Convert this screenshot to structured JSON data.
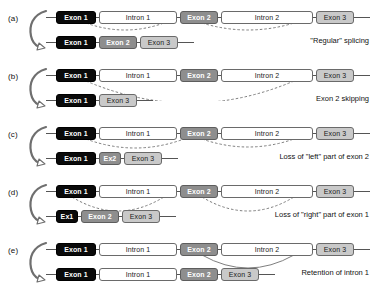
{
  "figure": {
    "panels": [
      {
        "letter": "(a)",
        "caption": "\"Regular\" splicing",
        "arrow_icon": "curved-splice-arrow-icon",
        "pre_mrna": [
          {
            "label": "Exon 1",
            "kind": "exon1",
            "width": 40
          },
          {
            "label": "Intron 1",
            "kind": "intron",
            "width": 78
          },
          {
            "label": "Exon 2",
            "kind": "exon2",
            "width": 38
          },
          {
            "label": "Intron 2",
            "kind": "intron",
            "width": 92
          },
          {
            "label": "Exon 3",
            "kind": "exon3",
            "width": 38
          }
        ],
        "mature_mrna": [
          {
            "label": "Exon 1",
            "kind": "exon1",
            "width": 40
          },
          {
            "label": "Exon 2",
            "kind": "exon2",
            "width": 38
          },
          {
            "label": "Exon 3",
            "kind": "exon3",
            "width": 38
          }
        ],
        "arcs": [
          {
            "x1": 40,
            "x2": 118,
            "depth": 7
          },
          {
            "x1": 156,
            "x2": 248,
            "depth": 7
          }
        ]
      },
      {
        "letter": "(b)",
        "caption": "Exon 2 skipping",
        "arrow_icon": "curved-splice-arrow-icon",
        "pre_mrna": [
          {
            "label": "Exon 1",
            "kind": "exon1",
            "width": 40
          },
          {
            "label": "Intron 1",
            "kind": "intron",
            "width": 78
          },
          {
            "label": "Exon 2",
            "kind": "exon2",
            "width": 38
          },
          {
            "label": "Intron 2",
            "kind": "intron",
            "width": 92
          },
          {
            "label": "Exon 3",
            "kind": "exon3",
            "width": 38
          }
        ],
        "mature_mrna": [
          {
            "label": "Exon 1",
            "kind": "exon1",
            "width": 40
          },
          {
            "label": "Exon 3",
            "kind": "exon3",
            "width": 38
          }
        ],
        "arcs": [
          {
            "x1": 40,
            "x2": 248,
            "depth": 22
          }
        ]
      },
      {
        "letter": "(c)",
        "caption": "Loss of \"left\" part of exon 2",
        "arrow_icon": "curved-splice-arrow-icon",
        "pre_mrna": [
          {
            "label": "Exon 1",
            "kind": "exon1",
            "width": 40
          },
          {
            "label": "Intron 1",
            "kind": "intron",
            "width": 78
          },
          {
            "label": "Exon 2",
            "kind": "exon2",
            "width": 38
          },
          {
            "label": "Intron 2",
            "kind": "intron",
            "width": 92
          },
          {
            "label": "Exon 3",
            "kind": "exon3",
            "width": 38
          }
        ],
        "mature_mrna": [
          {
            "label": "Exon 1",
            "kind": "exon1",
            "width": 40
          },
          {
            "label": "Ex2",
            "kind": "exon2",
            "width": 22
          },
          {
            "label": "Exon 3",
            "kind": "exon3",
            "width": 38
          }
        ],
        "arcs": [
          {
            "x1": 40,
            "x2": 138,
            "depth": 9
          },
          {
            "x1": 156,
            "x2": 248,
            "depth": 8
          }
        ]
      },
      {
        "letter": "(d)",
        "caption": "Loss of \"right\" part of exon 1",
        "arrow_icon": "curved-splice-arrow-icon",
        "pre_mrna": [
          {
            "label": "Exon 1",
            "kind": "exon1",
            "width": 40
          },
          {
            "label": "Intron 1",
            "kind": "intron",
            "width": 78
          },
          {
            "label": "Exon 2",
            "kind": "exon2",
            "width": 38
          },
          {
            "label": "Intron 2",
            "kind": "intron",
            "width": 92
          },
          {
            "label": "Exon 3",
            "kind": "exon3",
            "width": 38
          }
        ],
        "mature_mrna": [
          {
            "label": "Ex1",
            "kind": "exon1",
            "width": 22
          },
          {
            "label": "Exon 2",
            "kind": "exon2",
            "width": 38
          },
          {
            "label": "Exon 3",
            "kind": "exon3",
            "width": 38
          }
        ],
        "arcs": [
          {
            "x1": 26,
            "x2": 118,
            "depth": 14
          },
          {
            "x1": 156,
            "x2": 248,
            "depth": 14
          }
        ]
      },
      {
        "letter": "(e)",
        "caption": "Retention of intron 1",
        "arrow_icon": "curved-splice-arrow-icon",
        "pre_mrna": [
          {
            "label": "Exon 1",
            "kind": "exon1",
            "width": 40
          },
          {
            "label": "Intron 1",
            "kind": "intron",
            "width": 78
          },
          {
            "label": "Exon 2",
            "kind": "exon2",
            "width": 38
          },
          {
            "label": "Intron 2",
            "kind": "intron",
            "width": 92
          },
          {
            "label": "Exon 3",
            "kind": "exon3",
            "width": 38
          }
        ],
        "mature_mrna": [
          {
            "label": "Exon 1",
            "kind": "exon1",
            "width": 40
          },
          {
            "label": "Intron 1",
            "kind": "intron",
            "width": 78
          },
          {
            "label": "Exon 2",
            "kind": "exon2",
            "width": 38
          },
          {
            "label": "Exon 3",
            "kind": "exon3",
            "width": 38
          }
        ],
        "arcs": [
          {
            "x1": 156,
            "x2": 248,
            "depth": 13,
            "style": "solid"
          }
        ]
      }
    ],
    "colors": {
      "exon1": "#0a0a0a",
      "exon2": "#8e8e8e",
      "exon3": "#c9c9c9",
      "intron": "#ffffff",
      "outline": "#5a5a5a",
      "line": "#555555",
      "arc": "#6f6f6f"
    }
  }
}
